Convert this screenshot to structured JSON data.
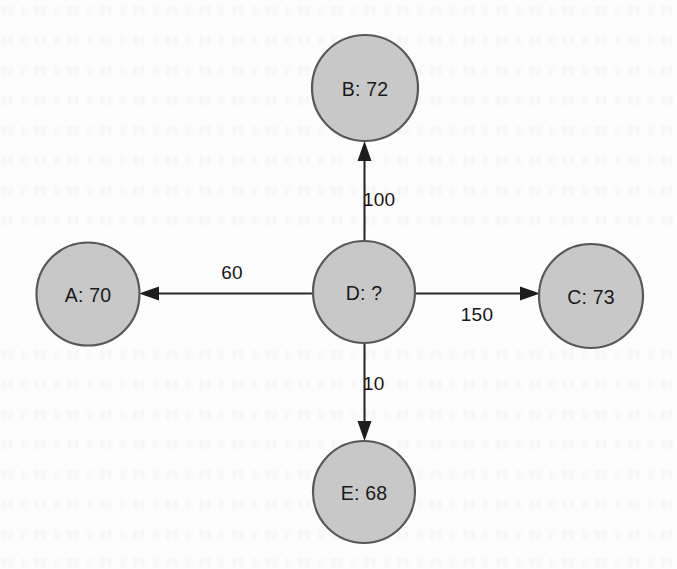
{
  "page": {
    "background_color": "#fdfdfd",
    "width": 677,
    "height": 569
  },
  "style": {
    "node_fill": "#c8c8c8",
    "node_stroke": "#58585a",
    "edge_color": "#2b2b2b",
    "label_color": "#1a1a1a"
  },
  "graph": {
    "type": "directed-graph",
    "center_node_id": "D",
    "nodes": [
      {
        "id": "B",
        "label": "B: 72",
        "value": "72",
        "cx": 365,
        "cy": 88,
        "r": 53
      },
      {
        "id": "A",
        "label": "A: 70",
        "value": "70",
        "cx": 88,
        "cy": 294,
        "r": 51.5
      },
      {
        "id": "D",
        "label": "D: ?",
        "value": "?",
        "cx": 364,
        "cy": 292,
        "r": 51
      },
      {
        "id": "C",
        "label": "C: 73",
        "value": "73",
        "cx": 591,
        "cy": 296,
        "r": 52
      },
      {
        "id": "E",
        "label": "E: 68",
        "value": "68",
        "cx": 364,
        "cy": 492,
        "r": 51
      }
    ],
    "edges": [
      {
        "from": "D",
        "to": "B",
        "weight": "100",
        "label_x": 363,
        "label_y": 199,
        "anchor": "start"
      },
      {
        "from": "D",
        "to": "A",
        "weight": "60",
        "label_x": 232,
        "label_y": 272,
        "anchor": "middle"
      },
      {
        "from": "D",
        "to": "C",
        "weight": "150",
        "label_x": 477,
        "label_y": 314,
        "anchor": "middle"
      },
      {
        "from": "D",
        "to": "E",
        "weight": "10",
        "label_x": 363,
        "label_y": 383,
        "anchor": "start"
      }
    ]
  }
}
